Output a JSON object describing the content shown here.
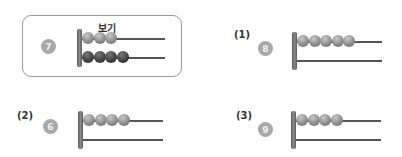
{
  "example": {
    "title": "보기",
    "number": "7",
    "top_beads": 3,
    "bottom_beads": 4
  },
  "questions": [
    {
      "label": "(1)",
      "number": "8",
      "top_beads": 5,
      "bottom_beads": 0
    },
    {
      "label": "(2)",
      "number": "6",
      "top_beads": 4,
      "bottom_beads": 0
    },
    {
      "label": "(3)",
      "number": "9",
      "top_beads": 4,
      "bottom_beads": 0
    }
  ],
  "colors": {
    "border": "#9a9a9a",
    "circle": "#a8a8a8",
    "bead_light": "#888888",
    "bead_dark": "#3e3e3e"
  }
}
